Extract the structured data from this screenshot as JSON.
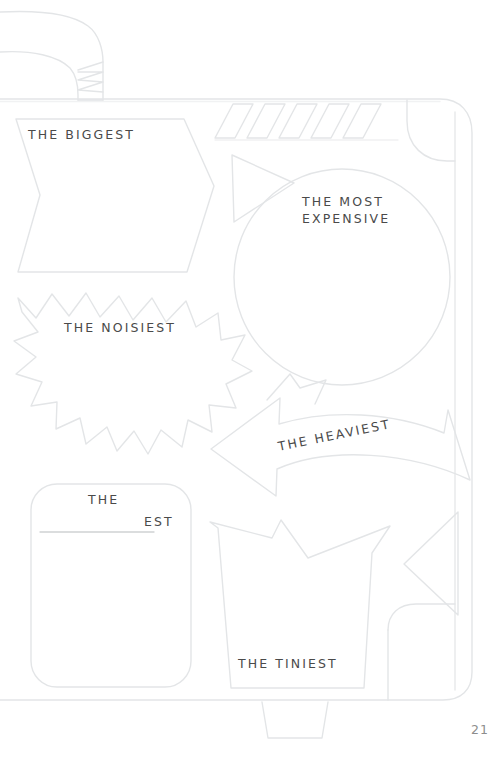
{
  "page": {
    "page_number": "21",
    "background_color": "#ffffff",
    "ink_color": "#e2e4e6",
    "text_color": "#4a4a4a"
  },
  "illustration": {
    "name": "suitcase-outline",
    "description": "Faint outline drawing of a suitcase with handle, corner protectors, diagonal stripes and a bottom foot"
  },
  "prompts": [
    {
      "id": "biggest",
      "shape": "banner-ribbon",
      "label": "THE BIGGEST"
    },
    {
      "id": "most-expensive",
      "shape": "circle-badge",
      "label_line1": "THE MOST",
      "label_line2": "EXPENSIVE"
    },
    {
      "id": "noisiest",
      "shape": "starburst",
      "label": "THE NOISIEST"
    },
    {
      "id": "heaviest",
      "shape": "curved-arrow-banner",
      "label": "THE HEAVIEST"
    },
    {
      "id": "tiniest",
      "shape": "tapered-box",
      "label": "THE TINIEST"
    },
    {
      "id": "blank",
      "shape": "rounded-square",
      "label_prefix": "THE",
      "label_suffix": "EST",
      "fill_in_blank": true
    }
  ]
}
